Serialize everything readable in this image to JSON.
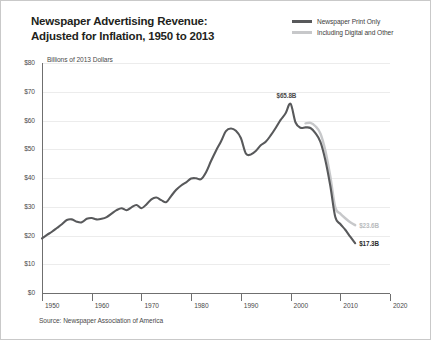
{
  "title": {
    "line1": "Newspaper Advertising Revenue:",
    "line2": "Adjusted for Inflation, 1950 to 2013"
  },
  "units_label": "Billions of 2013 Dollars",
  "source": "Source: Newspaper Association of America",
  "legend": {
    "items": [
      {
        "label": "Newspaper Print Only",
        "color": "#58595b",
        "key": "print"
      },
      {
        "label": "Including Digital and Other",
        "color": "#c7c8ca",
        "key": "digital"
      }
    ]
  },
  "annotations": {
    "peak": "$65.8B",
    "digital_end": "$23.6B",
    "print_end": "$17.3B"
  },
  "chart_data": {
    "type": "line",
    "title": "Newspaper Advertising Revenue: Adjusted for Inflation, 1950 to 2013",
    "xlabel": "",
    "ylabel": "Billions of 2013 Dollars",
    "xlim": [
      1950,
      2020
    ],
    "ylim": [
      0,
      80
    ],
    "xticks": [
      1950,
      1960,
      1970,
      1980,
      1990,
      2000,
      2010,
      2020
    ],
    "ytick_labels": [
      "$0",
      "$10",
      "$20",
      "$30",
      "$40",
      "$50",
      "$60",
      "$70",
      "$80"
    ],
    "yticks": [
      0,
      10,
      20,
      30,
      40,
      50,
      60,
      70,
      80
    ],
    "grid": true,
    "legend_position": "top-right",
    "series": [
      {
        "name": "Newspaper Print Only",
        "color": "#58595b",
        "x": [
          1950,
          1951,
          1952,
          1953,
          1954,
          1955,
          1956,
          1957,
          1958,
          1959,
          1960,
          1961,
          1962,
          1963,
          1964,
          1965,
          1966,
          1967,
          1968,
          1969,
          1970,
          1971,
          1972,
          1973,
          1974,
          1975,
          1976,
          1977,
          1978,
          1979,
          1980,
          1981,
          1982,
          1983,
          1984,
          1985,
          1986,
          1987,
          1988,
          1989,
          1990,
          1991,
          1992,
          1993,
          1994,
          1995,
          1996,
          1997,
          1998,
          1999,
          2000,
          2001,
          2002,
          2003,
          2004,
          2005,
          2006,
          2007,
          2008,
          2009,
          2010,
          2011,
          2012,
          2013
        ],
        "y": [
          19.0,
          20.2,
          21.3,
          22.6,
          23.9,
          25.4,
          25.6,
          24.8,
          24.6,
          25.8,
          26.1,
          25.6,
          25.8,
          26.4,
          27.6,
          28.8,
          29.5,
          28.8,
          29.8,
          30.6,
          29.5,
          30.8,
          32.6,
          33.2,
          32.3,
          31.6,
          33.8,
          35.9,
          37.4,
          38.5,
          39.8,
          39.9,
          39.6,
          42.0,
          45.9,
          49.5,
          52.7,
          56.3,
          57.2,
          56.4,
          53.9,
          48.5,
          48.2,
          49.4,
          51.4,
          52.6,
          54.8,
          57.4,
          60.2,
          62.5,
          65.8,
          59.3,
          57.5,
          57.6,
          57.4,
          55.6,
          52.6,
          46.2,
          37.2,
          26.4,
          24.0,
          22.0,
          19.6,
          17.3
        ],
        "end_label": "$17.3B",
        "peak": {
          "x": 2000,
          "y": 65.8,
          "label": "$65.8B"
        }
      },
      {
        "name": "Including Digital and Other",
        "color": "#c7c8ca",
        "x": [
          2003,
          2004,
          2005,
          2006,
          2007,
          2008,
          2009,
          2010,
          2011,
          2012,
          2013
        ],
        "y": [
          59.0,
          59.2,
          58.0,
          55.5,
          49.5,
          40.5,
          29.8,
          27.6,
          26.0,
          24.6,
          23.6
        ],
        "end_label": "$23.6B"
      }
    ]
  }
}
